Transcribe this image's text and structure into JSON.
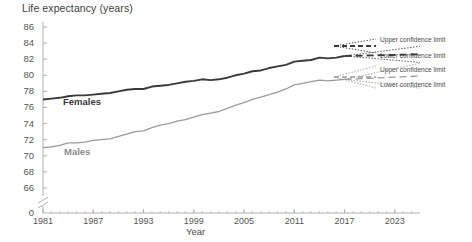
{
  "chart_data": {
    "type": "line",
    "title": "Life expectancy (years)",
    "xlabel": "Year",
    "ylabel": "",
    "grid": false,
    "axis_break": true,
    "xlim": [
      1981,
      2026
    ],
    "ylim": [
      65,
      86
    ],
    "x_ticks": [
      "1981",
      "1987",
      "1993",
      "1999",
      "2005",
      "2011",
      "2017",
      "2023"
    ],
    "y_ticks": [
      "0",
      "66",
      "68",
      "70",
      "72",
      "74",
      "76",
      "78",
      "80",
      "82",
      "84",
      "86"
    ],
    "series": [
      {
        "name": "Females",
        "color": "#3a3a3a",
        "x": [
          1981,
          1982,
          1983,
          1984,
          1985,
          1986,
          1987,
          1988,
          1989,
          1990,
          1991,
          1992,
          1993,
          1994,
          1995,
          1996,
          1997,
          1998,
          1999,
          2000,
          2001,
          2002,
          2003,
          2004,
          2005,
          2006,
          2007,
          2008,
          2009,
          2010,
          2011,
          2012,
          2013,
          2014,
          2015,
          2016,
          2017
        ],
        "values": [
          77.0,
          77.1,
          77.2,
          77.4,
          77.5,
          77.5,
          77.6,
          77.7,
          77.8,
          78.0,
          78.2,
          78.3,
          78.3,
          78.6,
          78.7,
          78.8,
          79.0,
          79.2,
          79.3,
          79.5,
          79.4,
          79.5,
          79.7,
          80.0,
          80.2,
          80.5,
          80.6,
          80.9,
          81.1,
          81.3,
          81.7,
          81.8,
          81.9,
          82.2,
          82.1,
          82.2,
          82.4
        ]
      },
      {
        "name": "Males",
        "color": "#9a9a9a",
        "x": [
          1981,
          1982,
          1983,
          1984,
          1985,
          1986,
          1987,
          1988,
          1989,
          1990,
          1991,
          1992,
          1993,
          1994,
          1995,
          1996,
          1997,
          1998,
          1999,
          2000,
          2001,
          2002,
          2003,
          2004,
          2005,
          2006,
          2007,
          2008,
          2009,
          2010,
          2011,
          2012,
          2013,
          2014,
          2015,
          2016,
          2017
        ],
        "values": [
          71.0,
          71.1,
          71.3,
          71.6,
          71.6,
          71.7,
          71.9,
          72.0,
          72.1,
          72.4,
          72.7,
          73.0,
          73.1,
          73.5,
          73.8,
          74.0,
          74.3,
          74.5,
          74.8,
          75.1,
          75.3,
          75.5,
          75.9,
          76.3,
          76.6,
          77.0,
          77.3,
          77.6,
          77.9,
          78.3,
          78.8,
          79.0,
          79.2,
          79.4,
          79.3,
          79.4,
          79.5
        ]
      }
    ],
    "projections": [
      {
        "name": "Females projection",
        "color": "#3a3a3a",
        "style": "dashed",
        "x": [
          2017,
          2026
        ],
        "values": [
          82.4,
          82.6
        ],
        "upper_limit": [
          82.4,
          83.6
        ],
        "lower_limit": [
          82.4,
          81.6
        ]
      },
      {
        "name": "Males projection",
        "color": "#9a9a9a",
        "style": "dashed",
        "x": [
          2017,
          2026
        ],
        "values": [
          79.5,
          79.9
        ],
        "upper_limit": [
          79.5,
          81.5
        ],
        "lower_limit": [
          79.5,
          78.4
        ]
      }
    ]
  },
  "legend": {
    "position": "right",
    "entries": [
      {
        "label": "Upper confidence limit",
        "series": "Females",
        "style": "dotted"
      },
      {
        "label": "Lower confidence limit",
        "series": "Females",
        "style": "dotted"
      },
      {
        "label": "Upper confidence limit",
        "series": "Males",
        "style": "dotted"
      },
      {
        "label": "Lower confidence limit",
        "series": "Males",
        "style": "dotted"
      }
    ]
  },
  "annotations": {
    "females_label": "Females",
    "males_label": "Males"
  },
  "colors": {
    "females": "#3a3a3a",
    "males": "#9a9a9a",
    "axis": "#b0b0b0",
    "text": "#4a4a4a"
  }
}
